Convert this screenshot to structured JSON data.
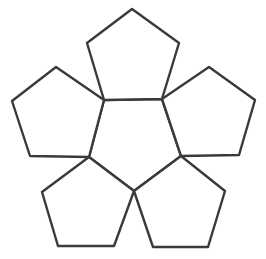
{
  "diagram": {
    "type": "dodecahedron-net-cluster",
    "stroke_color": "#3a3a3a",
    "fill_color": "#ffffff",
    "faces": [
      {
        "id": "center",
        "points": [
          [
            104,
            100
          ],
          [
            162,
            99
          ],
          [
            181,
            156
          ],
          [
            134,
            191
          ],
          [
            89,
            157
          ]
        ]
      },
      {
        "id": "top",
        "points": [
          [
            104,
            100
          ],
          [
            87,
            43
          ],
          [
            132,
            9
          ],
          [
            179,
            43
          ],
          [
            162,
            99
          ]
        ]
      },
      {
        "id": "upper-left",
        "points": [
          [
            104,
            100
          ],
          [
            56,
            67
          ],
          [
            12,
            101
          ],
          [
            30,
            156
          ],
          [
            89,
            157
          ]
        ]
      },
      {
        "id": "upper-right",
        "points": [
          [
            162,
            99
          ],
          [
            209,
            67
          ],
          [
            255,
            100
          ],
          [
            239,
            155
          ],
          [
            181,
            156
          ]
        ]
      },
      {
        "id": "lower-left",
        "points": [
          [
            89,
            157
          ],
          [
            42,
            192
          ],
          [
            58,
            246
          ],
          [
            114,
            246
          ],
          [
            134,
            191
          ]
        ]
      },
      {
        "id": "lower-right",
        "points": [
          [
            134,
            191
          ],
          [
            153,
            247
          ],
          [
            208,
            247
          ],
          [
            225,
            191
          ],
          [
            181,
            156
          ]
        ]
      }
    ]
  }
}
